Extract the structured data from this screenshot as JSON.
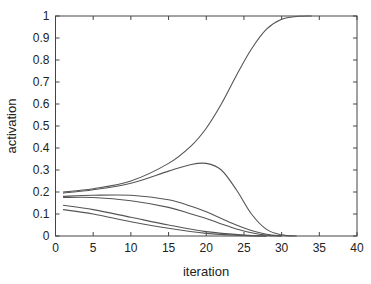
{
  "chart_data": {
    "type": "line",
    "title": "",
    "xlabel": "iteration",
    "ylabel": "activation",
    "xlim": [
      0,
      40
    ],
    "ylim": [
      0,
      1
    ],
    "xticks": [
      0,
      5,
      10,
      15,
      20,
      25,
      30,
      35,
      40
    ],
    "yticks": [
      0,
      0.1,
      0.2,
      0.3,
      0.4,
      0.5,
      0.6,
      0.7,
      0.8,
      0.9,
      1
    ],
    "xtick_labels": [
      "0",
      "5",
      "10",
      "15",
      "20",
      "25",
      "30",
      "35",
      "40"
    ],
    "ytick_labels": [
      "0",
      "0.1",
      "0.2",
      "0.3",
      "0.4",
      "0.5",
      "0.6",
      "0.7",
      "0.8",
      "0.9",
      "1"
    ],
    "grid": false,
    "legend": null,
    "line_color": "#555555",
    "series": [
      {
        "name": "unit-1",
        "x": [
          1,
          5,
          10,
          15,
          18,
          20,
          22,
          24,
          26,
          28,
          30,
          32,
          34
        ],
        "y": [
          0.2,
          0.215,
          0.25,
          0.33,
          0.41,
          0.49,
          0.6,
          0.73,
          0.85,
          0.94,
          0.985,
          0.998,
          1.0
        ]
      },
      {
        "name": "unit-2",
        "x": [
          1,
          5,
          10,
          15,
          18,
          20,
          22,
          24,
          26,
          28,
          30,
          32
        ],
        "y": [
          0.195,
          0.21,
          0.24,
          0.295,
          0.325,
          0.33,
          0.3,
          0.21,
          0.1,
          0.03,
          0.005,
          0.0
        ]
      },
      {
        "name": "unit-3",
        "x": [
          1,
          5,
          10,
          15,
          18,
          20,
          22,
          24,
          26,
          28,
          30
        ],
        "y": [
          0.18,
          0.185,
          0.185,
          0.165,
          0.135,
          0.11,
          0.08,
          0.05,
          0.025,
          0.008,
          0.0
        ]
      },
      {
        "name": "unit-4",
        "x": [
          1,
          5,
          10,
          15,
          18,
          20,
          22,
          24,
          26,
          28,
          30
        ],
        "y": [
          0.175,
          0.175,
          0.16,
          0.13,
          0.1,
          0.08,
          0.055,
          0.032,
          0.015,
          0.004,
          0.0
        ]
      },
      {
        "name": "unit-5",
        "x": [
          1,
          5,
          10,
          15,
          20,
          25,
          28
        ],
        "y": [
          0.14,
          0.12,
          0.085,
          0.05,
          0.02,
          0.004,
          0.0
        ]
      },
      {
        "name": "unit-6",
        "x": [
          1,
          5,
          10,
          15,
          20,
          25,
          28
        ],
        "y": [
          0.12,
          0.1,
          0.065,
          0.035,
          0.012,
          0.002,
          0.0
        ]
      }
    ]
  }
}
